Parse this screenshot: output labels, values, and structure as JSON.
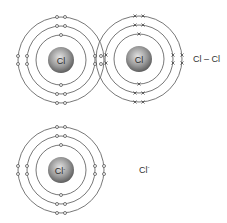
{
  "diagram": {
    "molecule": {
      "label": "Cl – Cl",
      "atoms": [
        {
          "symbol": "Cl",
          "center": [
            61,
            60
          ],
          "electron_style": "dot"
        },
        {
          "symbol": "Cl",
          "center": [
            139,
            59
          ],
          "electron_style": "cross"
        }
      ]
    },
    "ion": {
      "label_symbol": "Cl",
      "label_charge": "-",
      "atom": {
        "symbol": "Cl",
        "charge": "-",
        "center": [
          61,
          170
        ],
        "electron_style": "dot"
      }
    },
    "shell_radii": [
      25,
      34,
      43
    ],
    "nucleus_radius": 13,
    "colors": {
      "shell": "#555555",
      "nucleus_light": "#d8d8d8",
      "nucleus_dark": "#6a6a6a",
      "electron": "#555555",
      "text": "#333333"
    }
  }
}
